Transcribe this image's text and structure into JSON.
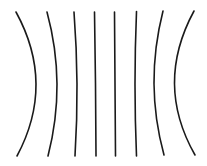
{
  "diagram": {
    "background": "#ffffff",
    "line_color": "#1a1a1a",
    "line_width": 1.6,
    "lines": [
      {
        "id": "line-1",
        "d": "M16,12 Q55.5,84 17,156"
      },
      {
        "id": "line-2",
        "d": "M47,12 Q66.5,84 48,156"
      },
      {
        "id": "line-3",
        "d": "M74,12 Q79.5,84 75,156"
      },
      {
        "id": "line-4",
        "d": "M94.5,12 Q95.75,84 96,156"
      },
      {
        "id": "line-5",
        "d": "M114.5,12 Q115,84 115.5,156"
      },
      {
        "id": "line-6",
        "d": "M136.5,11.5 Q133.5,84 136.5,156"
      },
      {
        "id": "line-7",
        "d": "M163,11 Q144.5,84 164,155"
      },
      {
        "id": "line-8",
        "d": "M194,11 Q154.5,84 195,155"
      }
    ]
  }
}
